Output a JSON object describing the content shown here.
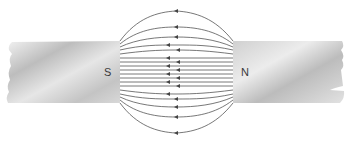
{
  "diagram": {
    "left_magnet": {
      "pole_label": "S"
    },
    "right_magnet": {
      "pole_label": "N"
    },
    "field_direction": "from N to S (arrows point left)",
    "colors": {
      "line": "#555555",
      "magnet_light": "#e8e8e8",
      "magnet_dark": "#b5b5b5",
      "background": "#ffffff"
    }
  }
}
